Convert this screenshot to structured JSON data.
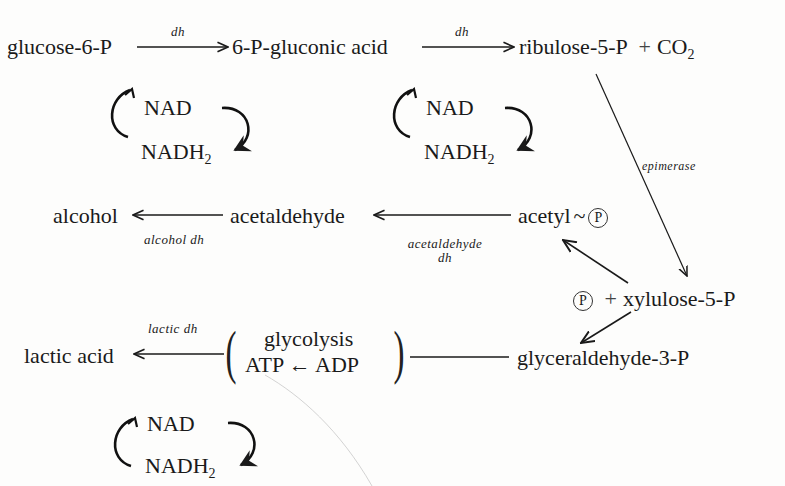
{
  "nodes": {
    "glucose6p": "glucose-6-P",
    "gluconic": "6-P-gluconic acid",
    "ribulose": "ribulose-5-P",
    "plus1": "+",
    "co2_base": "CO",
    "co2_sub": "2",
    "alcohol": "alcohol",
    "acetaldehyde": "acetaldehyde",
    "acetyl": "acetyl",
    "tilde": "~",
    "phosphate": "P",
    "plus2": "+",
    "xylulose": "xylulose-5-P",
    "lactic": "lactic acid",
    "glycolysis": "glycolysis",
    "atp_adp": "ATP ← ADP",
    "glyceraldehyde": "glyceraldehyde-3-P"
  },
  "enzymes": {
    "dh1": "dh",
    "dh2": "dh",
    "epimerase": "epimerase",
    "alcohol_dh": "alcohol dh",
    "acetaldehyde_dh_1": "acetaldehyde",
    "acetaldehyde_dh_2": "dh",
    "lactic_dh": "lactic dh"
  },
  "cofactors": [
    {
      "nad": "NAD",
      "nadh_base": "NADH",
      "nadh_sub": "2"
    },
    {
      "nad": "NAD",
      "nadh_base": "NADH",
      "nadh_sub": "2"
    },
    {
      "nad": "NAD",
      "nadh_base": "NADH",
      "nadh_sub": "2"
    }
  ]
}
